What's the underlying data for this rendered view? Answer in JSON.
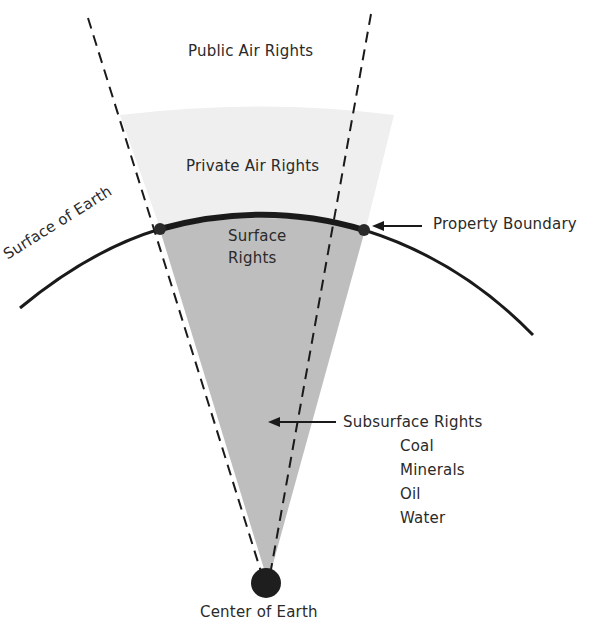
{
  "diagram": {
    "type": "land-rights-wedge",
    "labels": {
      "public_air": "Public Air Rights",
      "private_air": "Private Air Rights",
      "surface_line1": "Surface",
      "surface_line2": "Rights",
      "surface_of_earth": "Surface of Earth",
      "property_boundary": "Property Boundary",
      "subsurface": "Subsurface Rights",
      "subsurface_items": [
        "Coal",
        "Minerals",
        "Oil",
        "Water"
      ],
      "center": "Center of Earth"
    },
    "colors": {
      "background": "#ffffff",
      "private_air_fill": "#eeeeee",
      "subsurface_fill": "#bdbdbd",
      "line": "#1a1a1a"
    }
  }
}
